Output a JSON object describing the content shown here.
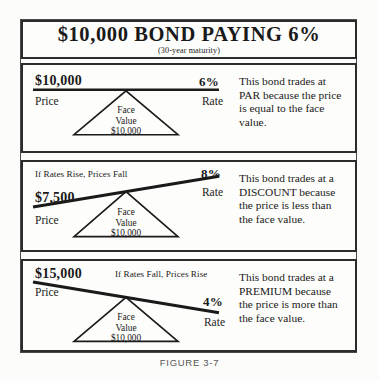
{
  "figure": {
    "caption": "FIGURE 3-7",
    "title": {
      "main": "$10,000 BOND PAYING 6%",
      "subtitle": "(30-year maturity)"
    }
  },
  "panels": [
    {
      "id": "par",
      "note": "",
      "price_amount": "$10,000",
      "price_label": "Price",
      "rate_amount": "6%",
      "rate_label": "Rate",
      "fulcrum": {
        "line1": "Face",
        "line2": "Value",
        "line3": "$10,000"
      },
      "explanation": "This bond trades at PAR because the price is equal to the face value.",
      "beam_tilt_deg": 0
    },
    {
      "id": "discount",
      "note": "If Rates Rise, Prices Fall",
      "price_amount": "$7,500",
      "price_label": "Price",
      "rate_amount": "8%",
      "rate_label": "Rate",
      "fulcrum": {
        "line1": "Face",
        "line2": "Value",
        "line3": "$10,000"
      },
      "explanation": "This bond trades at a DISCOUNT because the price is less than the face value.",
      "beam_tilt_deg": -9.5
    },
    {
      "id": "premium",
      "note": "If Rates Fall, Prices Rise",
      "price_amount": "$15,000",
      "price_label": "Price",
      "rate_amount": "4%",
      "rate_label": "Rate",
      "fulcrum": {
        "line1": "Face",
        "line2": "Value",
        "line3": "$10,000"
      },
      "explanation": "This bond trades at a PREMIUM because the price is more than the face value.",
      "beam_tilt_deg": 9.5
    }
  ],
  "colors": {
    "ink": "#1a1a1a",
    "rule": "#2b2b2b",
    "paper": "#fdfdfb",
    "caption": "#555555"
  }
}
